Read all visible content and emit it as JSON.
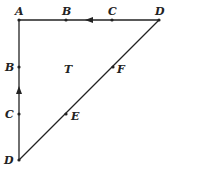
{
  "diagram": {
    "type": "triangle-path",
    "color": "#222222",
    "labels": {
      "top_A": "A",
      "top_B": "B",
      "top_C": "C",
      "top_D": "D",
      "left_B": "B",
      "left_C": "C",
      "bottom_D": "D",
      "hyp_F": "F",
      "hyp_E": "E",
      "center_T": "T"
    },
    "arrows": [
      {
        "edge": "top",
        "direction": "left"
      },
      {
        "edge": "left",
        "direction": "up"
      }
    ]
  }
}
